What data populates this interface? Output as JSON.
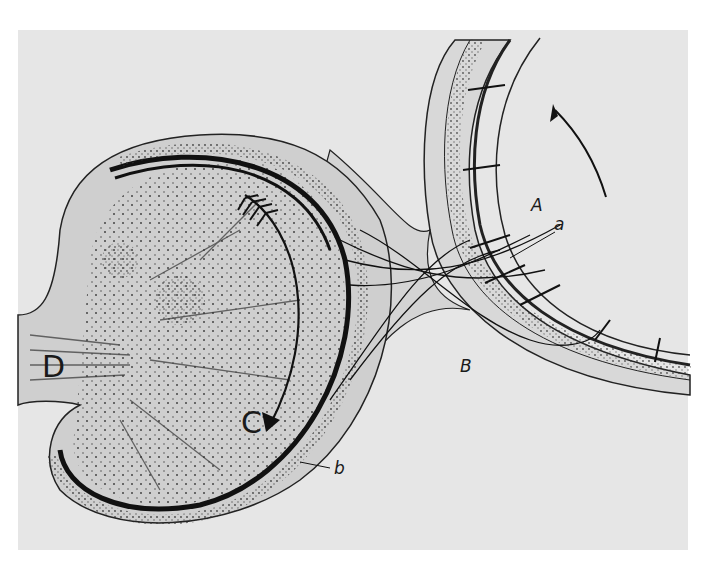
{
  "figure": {
    "background_color": "#e6e6e6",
    "ink_color": "#1a1a1a"
  },
  "labels": {
    "A": "A",
    "a": "a",
    "B": "B",
    "b": "b",
    "C": "C",
    "D": "D"
  },
  "arrows": [
    {
      "name": "arrow-A",
      "direction": "up-left",
      "near_label": "A"
    },
    {
      "name": "arrow-C",
      "direction": "down",
      "near_label": "C",
      "style": "feathered-tail"
    }
  ]
}
